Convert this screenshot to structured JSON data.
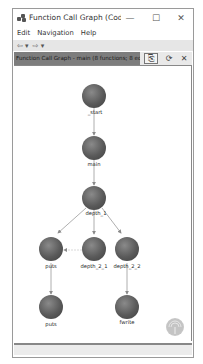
{
  "window": {
    "title": "Function Call Graph (CodeBr...",
    "controls": {
      "minimize": "—",
      "maximize": "☐",
      "close": "✕"
    }
  },
  "menu": {
    "items": [
      "Edit",
      "Navigation",
      "Help"
    ]
  },
  "toolbar": {
    "back": "⇦ ▾",
    "forward": "⇨ ▾"
  },
  "graph_header": {
    "title": "Function Call Graph - main (8 functions; 8 edges)",
    "buttons": {
      "export": "⎘",
      "refresh": "⟳",
      "close": "✕"
    }
  },
  "graph": {
    "nodes": [
      {
        "id": "start",
        "label": "_start",
        "x": 80,
        "y": 88
      },
      {
        "id": "main",
        "label": "main",
        "x": 80,
        "y": 140
      },
      {
        "id": "depth_1",
        "label": "depth_1",
        "x": 80,
        "y": 190
      },
      {
        "id": "puts_a",
        "label": "puts",
        "x": 37,
        "y": 241
      },
      {
        "id": "depth_2_1",
        "label": "depth_2_1",
        "x": 80,
        "y": 241
      },
      {
        "id": "depth_2_2",
        "label": "depth_2_2",
        "x": 113,
        "y": 241
      },
      {
        "id": "puts_b",
        "label": "puts",
        "x": 37,
        "y": 299
      },
      {
        "id": "fwrite",
        "label": "fwrite",
        "x": 113,
        "y": 299
      }
    ],
    "edges": [
      {
        "from": "start",
        "to": "main"
      },
      {
        "from": "main",
        "to": "depth_1"
      },
      {
        "from": "depth_1",
        "to": "puts_a"
      },
      {
        "from": "depth_1",
        "to": "depth_2_1"
      },
      {
        "from": "depth_1",
        "to": "depth_2_2"
      },
      {
        "from": "depth_2_1",
        "to": "puts_a",
        "style": "faint"
      },
      {
        "from": "puts_a",
        "to": "puts_b"
      },
      {
        "from": "depth_2_2",
        "to": "fwrite"
      }
    ],
    "node_color": "#5a5a5a",
    "edge_color": "#9a9a9a"
  }
}
